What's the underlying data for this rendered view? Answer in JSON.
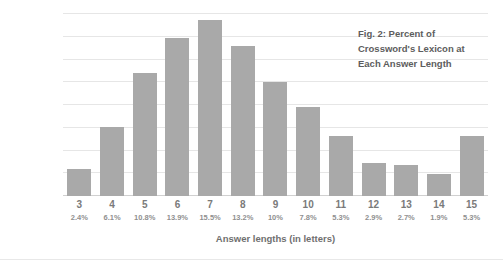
{
  "chart_data": {
    "type": "bar",
    "title_lines": [
      "Fig. 2: Percent of",
      "Crossword's Lexicon at",
      "Each Answer Length"
    ],
    "xlabel": "Answer lengths (in letters)",
    "ylabel": "Percent of crossword's lexicon",
    "categories": [
      "3",
      "4",
      "5",
      "6",
      "7",
      "8",
      "9",
      "10",
      "11",
      "12",
      "13",
      "14",
      "15"
    ],
    "values": [
      2.4,
      6.1,
      10.8,
      13.9,
      15.5,
      13.2,
      10,
      7.8,
      5.3,
      2.9,
      2.7,
      1.9,
      5.3
    ],
    "value_labels": [
      "2.4%",
      "6.1%",
      "10.8%",
      "13.9%",
      "15.5%",
      "13.2%",
      "10%",
      "7.8%",
      "5.3%",
      "2.9%",
      "2.7%",
      "1.9%",
      "5.3%"
    ],
    "ylim": [
      0,
      16
    ],
    "ytick_values": [
      0,
      2,
      4,
      6,
      8,
      10,
      12,
      14,
      16
    ],
    "ytick_labels": [
      "0%",
      "2%",
      "4%",
      "6%",
      "8%",
      "10%",
      "12%",
      "14%",
      "16%"
    ],
    "grid": true,
    "legend": null,
    "bar_color": "#a9a9a9",
    "gridline_color": "#e6e6e6",
    "text_color": "#6f6f6f",
    "background": "#ffffff"
  }
}
